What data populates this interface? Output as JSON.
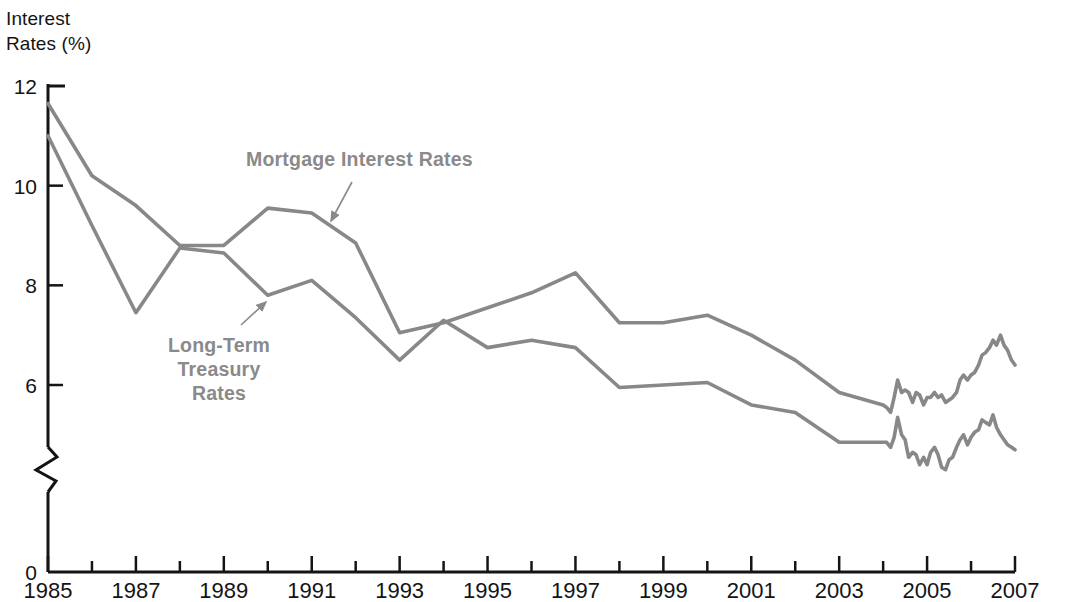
{
  "chart_data": {
    "type": "line",
    "title": "",
    "ylabel": "Interest Rates (%)",
    "xlabel": "",
    "ylim": [
      0,
      12
    ],
    "y_ticks": [
      0,
      6,
      8,
      10,
      12
    ],
    "y_axis_break": true,
    "y_axis_break_note": "axis broken between 0 and 6",
    "grid": false,
    "legend": "inline-annotations",
    "xlim": [
      1985,
      2007
    ],
    "x_ticks": [
      1985,
      1986,
      1987,
      1988,
      1989,
      1990,
      1991,
      1992,
      1993,
      1994,
      1995,
      1996,
      1997,
      1998,
      1999,
      2000,
      2001,
      2002,
      2003,
      2004,
      2005,
      2006,
      2007
    ],
    "x_tick_labels": [
      "1985",
      "",
      "1987",
      "",
      "1989",
      "",
      "1991",
      "",
      "1993",
      "",
      "1995",
      "",
      "1997",
      "",
      "1999",
      "",
      "2001",
      "",
      "2003",
      "",
      "2005",
      "",
      "2007"
    ],
    "series": [
      {
        "name": "Mortgage Interest Rates",
        "color": "#888888",
        "x": [
          1985,
          1986,
          1987,
          1988,
          1989,
          1990,
          1991,
          1992,
          1993,
          1994,
          1995,
          1996,
          1997,
          1998,
          1999,
          2000,
          2001,
          2002,
          2003,
          2004.0,
          2004.08,
          2004.17,
          2004.25,
          2004.33,
          2004.42,
          2004.5,
          2004.58,
          2004.67,
          2004.75,
          2004.83,
          2004.92,
          2005.0,
          2005.08,
          2005.17,
          2005.25,
          2005.33,
          2005.42,
          2005.5,
          2005.58,
          2005.67,
          2005.75,
          2005.83,
          2005.92,
          2006.0,
          2006.08,
          2006.17,
          2006.25,
          2006.33,
          2006.42,
          2006.5,
          2006.58,
          2006.67,
          2006.75,
          2006.83,
          2006.92,
          2007.0
        ],
        "values": [
          11.65,
          10.2,
          9.6,
          8.8,
          8.8,
          9.55,
          9.45,
          8.85,
          7.05,
          7.25,
          7.55,
          7.85,
          8.25,
          7.25,
          7.25,
          7.4,
          7.0,
          6.5,
          5.85,
          5.6,
          5.55,
          5.45,
          5.75,
          6.1,
          5.85,
          5.9,
          5.85,
          5.65,
          5.85,
          5.8,
          5.6,
          5.75,
          5.75,
          5.85,
          5.75,
          5.8,
          5.65,
          5.7,
          5.75,
          5.85,
          6.1,
          6.2,
          6.1,
          6.2,
          6.25,
          6.4,
          6.6,
          6.65,
          6.75,
          6.9,
          6.8,
          7.0,
          6.8,
          6.7,
          6.5,
          6.4
        ],
        "annotation": {
          "text": "Mortgage Interest Rates",
          "label_x": 246,
          "label_y": 166,
          "arrow_from": [
            352,
            182
          ],
          "arrow_to": [
            331,
            221
          ]
        }
      },
      {
        "name": "Long-Term Treasury Rates",
        "color": "#888888",
        "x": [
          1985,
          1986,
          1987,
          1988,
          1989,
          1990,
          1991,
          1992,
          1993,
          1994,
          1995,
          1996,
          1997,
          1998,
          1999,
          2000,
          2001,
          2002,
          2003,
          2004.0,
          2004.08,
          2004.17,
          2004.25,
          2004.33,
          2004.42,
          2004.5,
          2004.58,
          2004.67,
          2004.75,
          2004.83,
          2004.92,
          2005.0,
          2005.08,
          2005.17,
          2005.25,
          2005.33,
          2005.42,
          2005.5,
          2005.58,
          2005.67,
          2005.75,
          2005.83,
          2005.92,
          2006.0,
          2006.08,
          2006.17,
          2006.25,
          2006.33,
          2006.42,
          2006.5,
          2006.58,
          2006.67,
          2006.75,
          2006.83,
          2006.92,
          2007.0
        ],
        "values": [
          11.0,
          9.2,
          7.45,
          8.75,
          8.65,
          7.8,
          8.1,
          7.35,
          6.5,
          7.3,
          6.75,
          6.9,
          6.75,
          5.95,
          6.0,
          6.05,
          5.6,
          5.45,
          4.85,
          4.85,
          4.85,
          4.75,
          4.95,
          5.35,
          5.0,
          4.9,
          4.55,
          4.65,
          4.6,
          4.4,
          4.55,
          4.4,
          4.65,
          4.75,
          4.6,
          4.35,
          4.3,
          4.5,
          4.55,
          4.75,
          4.9,
          5.0,
          4.8,
          4.95,
          5.05,
          5.1,
          5.3,
          5.25,
          5.2,
          5.4,
          5.15,
          5.0,
          4.9,
          4.8,
          4.75,
          4.7
        ],
        "annotation": {
          "text_lines": [
            "Long-Term",
            "Treasury",
            "Rates"
          ],
          "label_x": 219,
          "label_y": 352,
          "arrow_from": [
            241,
            325
          ],
          "arrow_to": [
            266,
            302
          ]
        }
      }
    ]
  },
  "axis": {
    "y_title_line1": "Interest",
    "y_title_line2": "Rates (%)",
    "y_tick_labels": [
      "12",
      "10",
      "8",
      "6",
      "0"
    ],
    "x_tick_labels_visible": [
      "1985",
      "1987",
      "1989",
      "1991",
      "1993",
      "1995",
      "1997",
      "1999",
      "2001",
      "2003",
      "2005",
      "2007"
    ]
  },
  "annotations": {
    "mortgage_label": "Mortgage Interest Rates",
    "treasury_label_line1": "Long-Term",
    "treasury_label_line2": "Treasury",
    "treasury_label_line3": "Rates"
  },
  "colors": {
    "line": "#888888",
    "axis": "#141414",
    "annotation_text": "#8a8a8a",
    "background": "#ffffff"
  }
}
